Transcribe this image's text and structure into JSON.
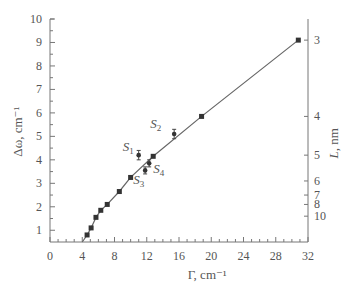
{
  "chart_data": {
    "type": "scatter",
    "title": "",
    "xlabel": "Γ, cm⁻¹",
    "ylabel": "Δω, cm⁻¹",
    "y2label": "L, nm",
    "xlim": [
      0,
      32
    ],
    "ylim": [
      0.5,
      10
    ],
    "x_ticks": [
      0,
      4,
      8,
      12,
      16,
      20,
      24,
      28,
      32
    ],
    "y_ticks": [
      1,
      2,
      3,
      4,
      5,
      6,
      7,
      8,
      9,
      10
    ],
    "y2_ticks": [
      {
        "label": "3",
        "y": 9.1
      },
      {
        "label": "4",
        "y": 5.85
      },
      {
        "label": "5",
        "y": 4.2
      },
      {
        "label": "6",
        "y": 3.1
      },
      {
        "label": "7",
        "y": 2.5
      },
      {
        "label": "8",
        "y": 2.1
      },
      {
        "label": "10",
        "y": 1.6
      }
    ],
    "grid": false,
    "legend": null,
    "series": [
      {
        "name": "calculated",
        "marker": "square",
        "line": true,
        "x": [
          4.0,
          4.6,
          5.1,
          5.7,
          6.3,
          7.1,
          8.6,
          10.0,
          12.8,
          18.8,
          30.8
        ],
        "y": [
          0.5,
          0.8,
          1.1,
          1.55,
          1.85,
          2.1,
          2.65,
          3.25,
          4.15,
          5.85,
          9.1
        ]
      },
      {
        "name": "experimental",
        "marker": "circle",
        "error_bars": true,
        "points": [
          {
            "label": "S1",
            "x": 11.0,
            "y": 4.2,
            "err": 0.2
          },
          {
            "label": "S2",
            "x": 15.4,
            "y": 5.1,
            "err": 0.2
          },
          {
            "label": "S3",
            "x": 11.8,
            "y": 3.55,
            "err": 0.15
          },
          {
            "label": "S4",
            "x": 12.3,
            "y": 3.85,
            "err": 0.15
          }
        ]
      }
    ]
  }
}
